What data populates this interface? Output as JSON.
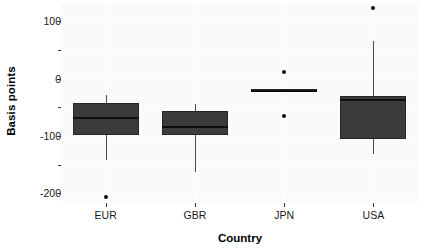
{
  "chart_data": {
    "type": "box",
    "title": "",
    "xlabel": "Country",
    "ylabel": "Basis points",
    "categories": [
      "EUR",
      "GBR",
      "JPN",
      "USA"
    ],
    "ylim": [
      -215,
      130
    ],
    "ytick_major": [
      100,
      0,
      -100,
      -200
    ],
    "ytick_minor": [
      50,
      -50,
      -150
    ],
    "ytick_labels": [
      "100",
      "0",
      "-100",
      "-200"
    ],
    "grid": true,
    "legend": "none",
    "boxes": [
      {
        "category": "EUR",
        "whisker_low": -142,
        "q1": -99,
        "median": -68,
        "q3": -42,
        "whisker_high": -28,
        "outliers": [
          -207
        ]
      },
      {
        "category": "GBR",
        "whisker_low": -162,
        "q1": -99,
        "median": -85,
        "q3": -56,
        "whisker_high": -45,
        "outliers": []
      },
      {
        "category": "JPN",
        "whisker_low": -24,
        "q1": -24,
        "median": -21,
        "q3": -18,
        "whisker_high": -18,
        "outliers": [
          12,
          -66
        ]
      },
      {
        "category": "USA",
        "whisker_low": -131,
        "q1": -105,
        "median": -37,
        "q3": -30,
        "whisker_high": 65,
        "outliers": [
          123
        ]
      }
    ]
  },
  "colors": {
    "box_fill": "#3b3b3b",
    "box_border": "#262626",
    "median": "#0d0d0d",
    "whisker": "#4a4a4a",
    "outlier": "#0a0a0a",
    "panel_background": "#fafafa",
    "grid": "#ffffff",
    "axis_text": "#1a1a1a"
  }
}
